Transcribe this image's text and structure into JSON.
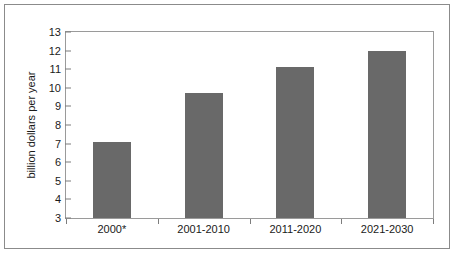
{
  "chart_data": {
    "type": "bar",
    "title": "",
    "subtitle": "",
    "xlabel": "",
    "ylabel": "billion dollars per year",
    "categories": [
      "2000*",
      "2001-2010",
      "2011-2020",
      "2021-2030"
    ],
    "values": [
      7.1,
      9.7,
      11.1,
      12.0
    ],
    "ylim": [
      3,
      13
    ],
    "ytick_labels": [
      "13",
      "12",
      "11",
      "10",
      "9",
      "8",
      "7",
      "6",
      "5",
      "4",
      "3"
    ],
    "ytick_values": [
      13,
      12,
      11,
      10,
      9,
      8,
      7,
      6,
      5,
      4,
      3
    ],
    "grid": false,
    "legend": null,
    "legend_position": "none",
    "bar_color": "#696969",
    "plot_border_color": "#9a9a9a",
    "frame_color": "#8b8b8b",
    "background_color": "#ffffff",
    "text_color": "#1a1a1a",
    "annotations": []
  }
}
